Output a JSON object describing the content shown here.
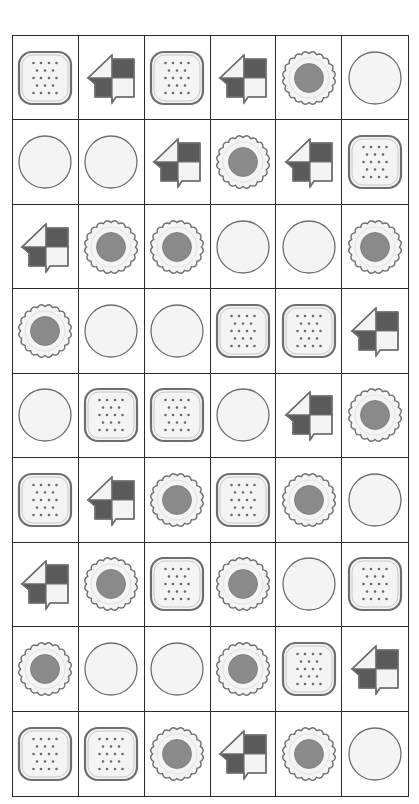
{
  "board": {
    "rows": 9,
    "cols": 6,
    "tile_types": {
      "cracker": "cracker-icon",
      "arrow": "arrow-icon",
      "flower": "flower-cookie-icon",
      "plain": "plain-cookie-icon"
    },
    "grid": [
      [
        "cracker",
        "arrow",
        "cracker",
        "arrow",
        "flower",
        "plain"
      ],
      [
        "plain",
        "plain",
        "arrow",
        "flower",
        "arrow",
        "cracker"
      ],
      [
        "arrow",
        "flower",
        "flower",
        "plain",
        "plain",
        "flower"
      ],
      [
        "flower",
        "plain",
        "plain",
        "cracker",
        "cracker",
        "arrow"
      ],
      [
        "plain",
        "cracker",
        "cracker",
        "plain",
        "arrow",
        "flower"
      ],
      [
        "cracker",
        "arrow",
        "flower",
        "cracker",
        "flower",
        "plain"
      ],
      [
        "arrow",
        "flower",
        "cracker",
        "flower",
        "plain",
        "cracker"
      ],
      [
        "flower",
        "plain",
        "plain",
        "flower",
        "cracker",
        "arrow"
      ],
      [
        "cracker",
        "cracker",
        "flower",
        "arrow",
        "flower",
        "plain"
      ]
    ]
  },
  "colors": {
    "grid_line": "#2a2a2a",
    "outline": "#6e6e6e",
    "dark_fill": "#5a5a5a",
    "light_fill": "#f4f4f4",
    "center_fill": "#8a8a8a",
    "dot": "#6a6a6a"
  }
}
